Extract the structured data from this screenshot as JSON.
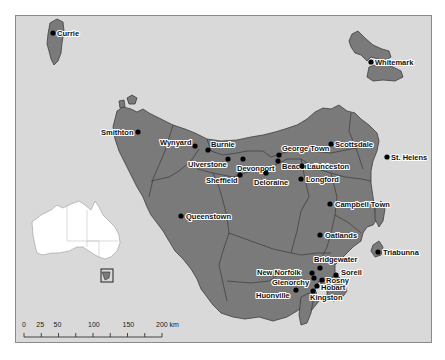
{
  "map": {
    "colors": {
      "water": "#d9d9d9",
      "land": "#7a7a7a",
      "boundary": "#3a3a3a",
      "inset_land": "#ffffff"
    },
    "cities": [
      {
        "name": "Currie",
        "x": 37,
        "y": 17,
        "lx": 4,
        "ly": 3
      },
      {
        "name": "Whitemark",
        "x": 355,
        "y": 46,
        "lx": 4,
        "ly": 3
      },
      {
        "name": "Smithton",
        "x": 122,
        "y": 116,
        "lx": -37,
        "ly": 3
      },
      {
        "name": "Wynyard",
        "x": 179,
        "y": 130,
        "lx": -35,
        "ly": -1
      },
      {
        "name": "Burnie",
        "x": 192,
        "y": 134,
        "lx": 3,
        "ly": -3
      },
      {
        "name": "Ulverstone",
        "x": 212,
        "y": 143,
        "lx": -40,
        "ly": 8
      },
      {
        "name": "Devonport",
        "x": 227,
        "y": 143,
        "lx": -6,
        "ly": 12
      },
      {
        "name": "George Town",
        "x": 263,
        "y": 139,
        "lx": 3,
        "ly": -4
      },
      {
        "name": "Beaconsfield",
        "x": 262,
        "y": 145,
        "lx": 4,
        "ly": 8
      },
      {
        "name": "Scottsdale",
        "x": 315,
        "y": 128,
        "lx": 4,
        "ly": 3
      },
      {
        "name": "St. Helens",
        "x": 371,
        "y": 141,
        "lx": 4,
        "ly": 3
      },
      {
        "name": "Sheffield",
        "x": 224,
        "y": 159,
        "lx": -34,
        "ly": 8
      },
      {
        "name": "Launceston",
        "x": 286,
        "y": 150,
        "lx": 5,
        "ly": 3
      },
      {
        "name": "Deloraine",
        "x": 250,
        "y": 157,
        "lx": -12,
        "ly": 12
      },
      {
        "name": "Longford",
        "x": 285,
        "y": 163,
        "lx": 5,
        "ly": 3
      },
      {
        "name": "Campbell Town",
        "x": 314,
        "y": 188,
        "lx": 5,
        "ly": 3
      },
      {
        "name": "Queenstown",
        "x": 165,
        "y": 200,
        "lx": 5,
        "ly": 3
      },
      {
        "name": "Oatlands",
        "x": 304,
        "y": 219,
        "lx": 5,
        "ly": 3
      },
      {
        "name": "Triabunna",
        "x": 362,
        "y": 236,
        "lx": 5,
        "ly": 3
      },
      {
        "name": "Bridgewater",
        "x": 304,
        "y": 252,
        "lx": -6,
        "ly": -6
      },
      {
        "name": "New Norfolk",
        "x": 296,
        "y": 257,
        "lx": -55,
        "ly": 2
      },
      {
        "name": "Sorell",
        "x": 320,
        "y": 259,
        "lx": 5,
        "ly": 0
      },
      {
        "name": "Glenorchy",
        "x": 298,
        "y": 262,
        "lx": -42,
        "ly": 7
      },
      {
        "name": "Rosny",
        "x": 306,
        "y": 264,
        "lx": 4,
        "ly": 3
      },
      {
        "name": "Hobart",
        "x": 301,
        "y": 270,
        "lx": 4,
        "ly": 4
      },
      {
        "name": "Kingston",
        "x": 297,
        "y": 275,
        "lx": -3,
        "ly": 9
      },
      {
        "name": "Huonville",
        "x": 280,
        "y": 274,
        "lx": -40,
        "ly": 8
      }
    ],
    "scale_bar": {
      "labels": [
        "0",
        "25",
        "50",
        "100",
        "150",
        "200 km"
      ],
      "values": [
        0,
        25,
        50,
        100,
        150,
        200
      ],
      "ticks": [
        0,
        25,
        50,
        75,
        100,
        125,
        150,
        175,
        200
      ],
      "unit": "km"
    },
    "inset": {
      "label": "Australia locator",
      "highlight": "Tasmania"
    }
  }
}
